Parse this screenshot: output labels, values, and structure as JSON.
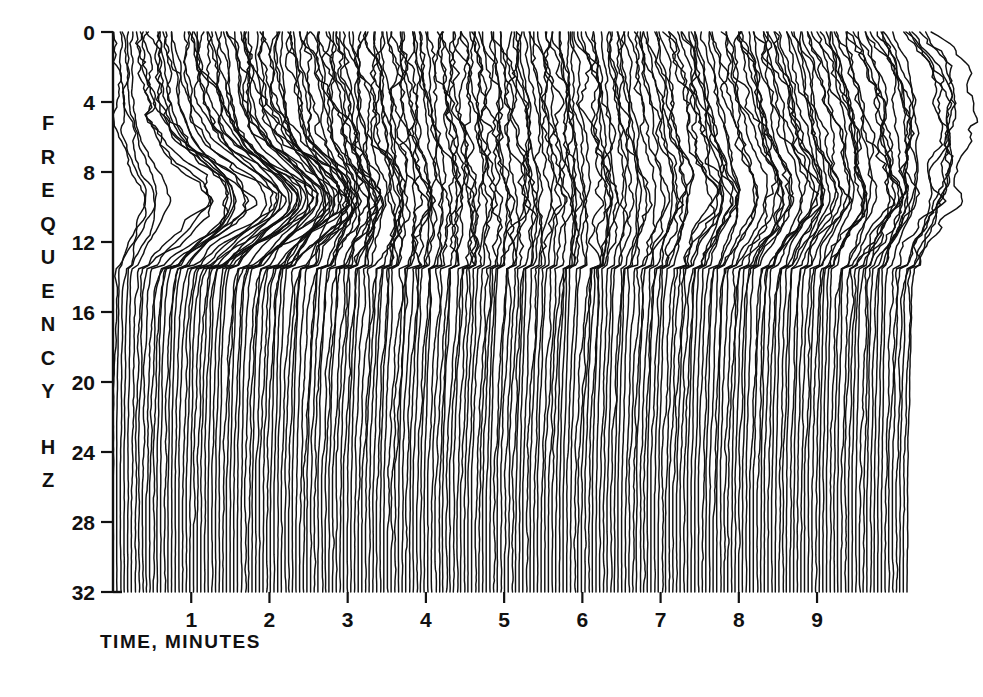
{
  "chart_data": {
    "type": "line",
    "title": "",
    "subtitle": "",
    "xlabel": "TIME, MINUTES",
    "ylabel": "F R E Q U E N C Y   H Z",
    "ylabel_letters": [
      "F",
      "R",
      "E",
      "Q",
      "U",
      "E",
      "N",
      "C",
      "Y",
      "",
      "H",
      "Z"
    ],
    "xlim": [
      0,
      10.15
    ],
    "ylim": [
      0,
      32
    ],
    "y_inverted": true,
    "grid": false,
    "legend": null,
    "xticks": [
      1,
      2,
      3,
      4,
      5,
      6,
      7,
      8,
      9
    ],
    "xtick_labels": [
      "1",
      "2",
      "3",
      "4",
      "5",
      "6",
      "7",
      "8",
      "9"
    ],
    "yticks": [
      0,
      4,
      8,
      12,
      16,
      20,
      24,
      28,
      32
    ],
    "ytick_labels": [
      "0",
      "4",
      "8",
      "12",
      "16",
      "20",
      "24",
      "28",
      "32"
    ],
    "minor_xticks_per_major": 10,
    "plot_description": "Compressed spectral array (waterfall) of EEG power spectra. Each vertical trace is one power spectrum plotted with frequency increasing downward from 0 to 32 Hz; successive traces are offset to the right in time from 0 to about 10 minutes. Spectral amplitude deflects each trace toward the right. Large low-frequency (8-13 Hz) power dominates the first 2 minutes, decays through minutes 3-6, and a broad 6-11 Hz band of activity re-emerges and intensifies after minute 7, ending in a large peak near 5 Hz at the final trace.",
    "n_traces": 218,
    "trace_spacing_minutes": 0.0465,
    "axis_color": "#111111",
    "trace_color": "#111111",
    "background_color": "#ffffff",
    "series_note": "Amplitude envelope per trace is generated from the band-activity model below.",
    "bands": [
      {
        "name": "delta",
        "center_hz": 2.0,
        "width_hz": 1.8
      },
      {
        "name": "theta",
        "center_hz": 5.5,
        "width_hz": 2.2
      },
      {
        "name": "alpha",
        "center_hz": 9.6,
        "width_hz": 2.0
      },
      {
        "name": "low-beta",
        "center_hz": 14.5,
        "width_hz": 2.6
      },
      {
        "name": "beta",
        "center_hz": 20.0,
        "width_hz": 3.0
      }
    ],
    "band_time_envelopes": {
      "comment": "amplitude (in pixels of rightward deflection) sampled at the listed times in minutes",
      "times": [
        0.0,
        0.5,
        1.0,
        1.5,
        2.0,
        2.5,
        3.0,
        3.5,
        4.0,
        4.5,
        5.0,
        5.5,
        6.0,
        6.5,
        7.0,
        7.5,
        8.0,
        8.5,
        9.0,
        9.5,
        10.1
      ],
      "delta": [
        4,
        5,
        6,
        6,
        5,
        5,
        4,
        4,
        4,
        4,
        4,
        4,
        5,
        5,
        6,
        7,
        8,
        9,
        10,
        12,
        30
      ],
      "theta": [
        6,
        10,
        14,
        14,
        11,
        10,
        9,
        9,
        9,
        10,
        11,
        12,
        13,
        15,
        18,
        20,
        22,
        24,
        26,
        28,
        40
      ],
      "alpha": [
        30,
        78,
        92,
        84,
        62,
        40,
        26,
        20,
        17,
        16,
        16,
        17,
        19,
        24,
        32,
        40,
        44,
        42,
        38,
        34,
        30
      ],
      "low-beta": [
        4,
        8,
        10,
        11,
        12,
        14,
        16,
        16,
        15,
        14,
        14,
        15,
        14,
        13,
        12,
        11,
        10,
        9,
        9,
        8,
        8
      ],
      "beta": [
        2,
        3,
        4,
        4,
        5,
        5,
        6,
        6,
        6,
        6,
        6,
        6,
        6,
        6,
        5,
        5,
        5,
        5,
        4,
        4,
        4
      ]
    },
    "noise_amplitude_px": 3.2,
    "baseline_suppression_hz": 13.5
  },
  "axes": {
    "x_axis_title": "TIME, MINUTES",
    "y_axis_letters": [
      "F",
      "R",
      "E",
      "Q",
      "U",
      "E",
      "N",
      "C",
      "Y",
      "H",
      "Z"
    ]
  }
}
